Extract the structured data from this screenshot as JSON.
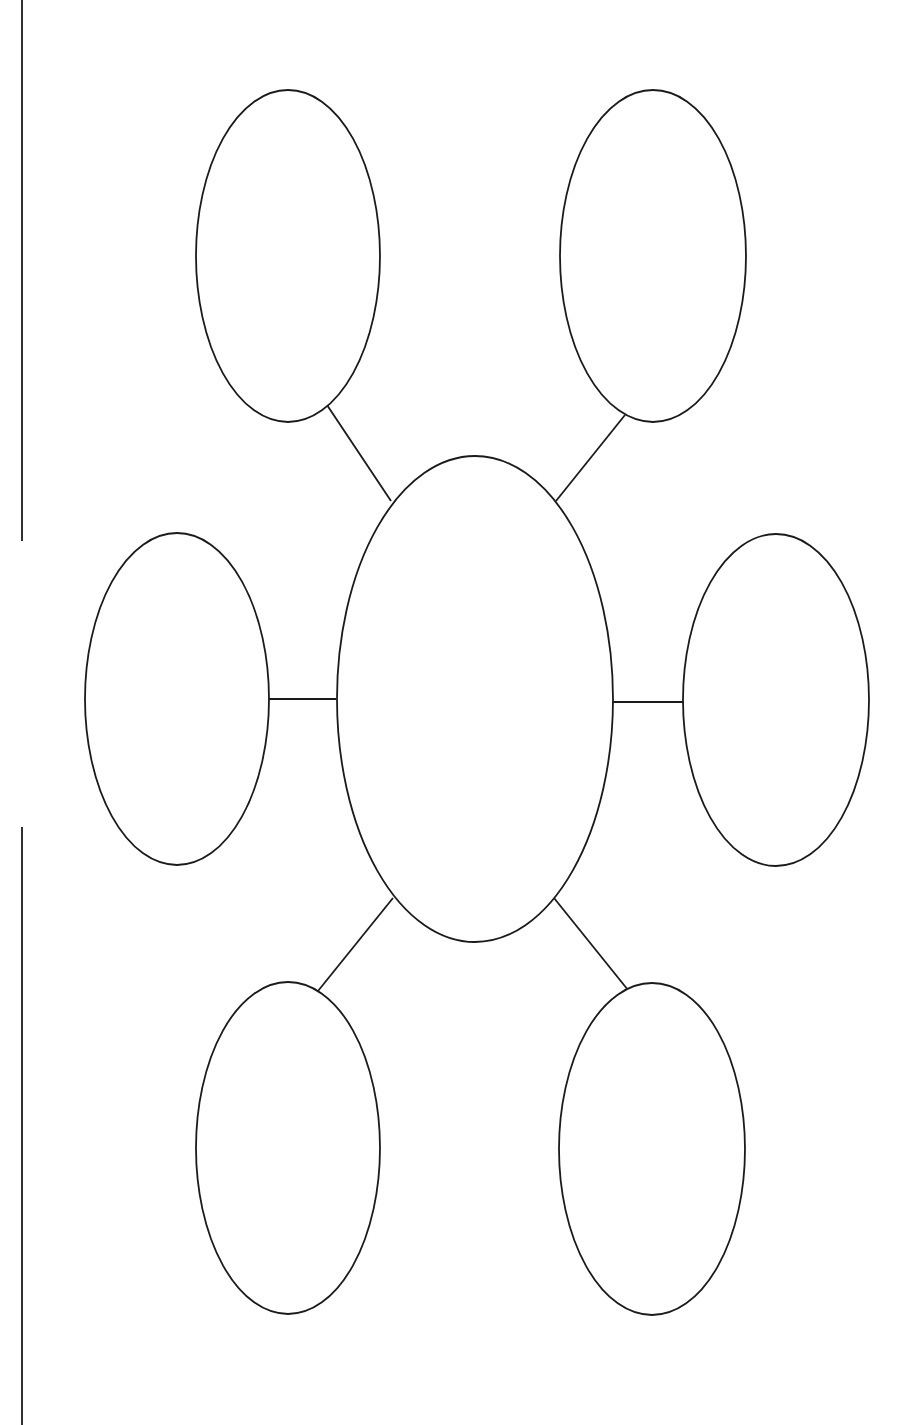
{
  "diagram": {
    "type": "bubble-map",
    "canvas": {
      "width": 913,
      "height": 1425,
      "background": "#ffffff"
    },
    "stroke_color": "#1a1a1a",
    "margin_lines": [
      {
        "id": "margin-line-top",
        "x": 22,
        "y1": 0,
        "y2": 541
      },
      {
        "id": "margin-line-bottom",
        "x": 22,
        "y1": 827,
        "y2": 1425
      }
    ],
    "center_bubble": {
      "id": "center",
      "label": "",
      "cx": 475,
      "cy": 699,
      "rx": 138,
      "ry": 243
    },
    "outer_bubbles": [
      {
        "id": "top-left",
        "label": "",
        "cx": 288,
        "cy": 256,
        "rx": 92,
        "ry": 166
      },
      {
        "id": "top-right",
        "label": "",
        "cx": 653,
        "cy": 256,
        "rx": 93,
        "ry": 166
      },
      {
        "id": "middle-left",
        "label": "",
        "cx": 177,
        "cy": 699,
        "rx": 92,
        "ry": 166
      },
      {
        "id": "middle-right",
        "label": "",
        "cx": 776,
        "cy": 700,
        "rx": 93,
        "ry": 166
      },
      {
        "id": "bottom-left",
        "label": "",
        "cx": 288,
        "cy": 1148,
        "rx": 92,
        "ry": 166
      },
      {
        "id": "bottom-right",
        "label": "",
        "cx": 652,
        "cy": 1149,
        "rx": 93,
        "ry": 166
      }
    ],
    "connectors": [
      {
        "id": "connector-top-left",
        "x1": 327,
        "y1": 405,
        "x2": 391,
        "y2": 501
      },
      {
        "id": "connector-top-right",
        "x1": 625,
        "y1": 415,
        "x2": 556,
        "y2": 501
      },
      {
        "id": "connector-middle-left",
        "x1": 269,
        "y1": 699,
        "x2": 336,
        "y2": 699
      },
      {
        "id": "connector-middle-right",
        "x1": 613,
        "y1": 702,
        "x2": 683,
        "y2": 702
      },
      {
        "id": "connector-bottom-left",
        "x1": 318,
        "y1": 991,
        "x2": 393,
        "y2": 898
      },
      {
        "id": "connector-bottom-right",
        "x1": 554,
        "y1": 898,
        "x2": 628,
        "y2": 990
      }
    ]
  }
}
